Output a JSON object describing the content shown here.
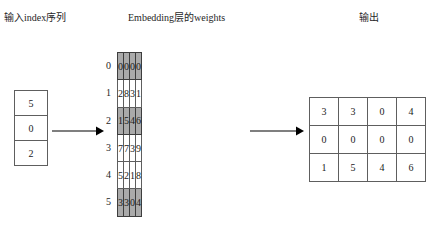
{
  "headings": {
    "input": "输入index序列",
    "weights": "Embedding层的weights",
    "output": "输出"
  },
  "input_sequence": {
    "name": "input-index-column",
    "values": [
      5,
      0,
      2
    ]
  },
  "embedding_weights": {
    "name": "embedding-weight-matrix",
    "row_labels": [
      0,
      1,
      2,
      3,
      4,
      5
    ],
    "rows": [
      [
        0,
        0,
        0,
        0
      ],
      [
        2,
        8,
        3,
        1
      ],
      [
        1,
        5,
        4,
        6
      ],
      [
        7,
        7,
        3,
        9
      ],
      [
        5,
        2,
        1,
        8
      ],
      [
        3,
        3,
        0,
        4
      ]
    ],
    "highlighted_rows": [
      0,
      2,
      5
    ],
    "highlight_color": "#aaaaaa"
  },
  "output_matrix": {
    "name": "output-embedding-matrix",
    "rows": [
      [
        3,
        3,
        0,
        4
      ],
      [
        0,
        0,
        0,
        0
      ],
      [
        1,
        5,
        4,
        6
      ]
    ]
  },
  "arrows": [
    {
      "name": "arrow-input-to-weights"
    },
    {
      "name": "arrow-weights-to-output"
    }
  ],
  "colors": {
    "border": "#5e5e5e",
    "shaded_border": "#3d3d3d",
    "text": "#1a1a1a",
    "arrow": "#000000"
  }
}
